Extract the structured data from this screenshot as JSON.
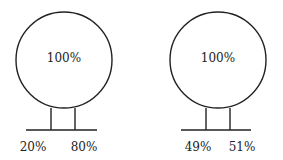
{
  "diagrams": [
    {
      "circle_label": "100%",
      "left_label": "20%",
      "right_label": "80%"
    },
    {
      "circle_label": "100%",
      "left_label": "49%",
      "right_label": "51%"
    }
  ],
  "colors": {
    "stroke": "#222222",
    "background": "#ffffff"
  }
}
